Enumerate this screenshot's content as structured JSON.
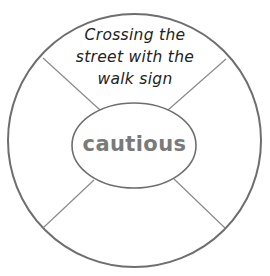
{
  "diagram": {
    "type": "word-wheel-organizer",
    "center": {
      "label": "cautious"
    },
    "sectors": [
      {
        "position": "top",
        "lines": [
          "Crossing the",
          "street with the",
          "walk sign"
        ]
      },
      {
        "position": "left",
        "lines": []
      },
      {
        "position": "right",
        "lines": []
      },
      {
        "position": "bottom",
        "lines": []
      }
    ],
    "colors": {
      "outline": "#6e6e6e",
      "divider": "#8a8a8a",
      "center_text": "#7a7a7a",
      "sector_text": "#222222",
      "background": "#ffffff"
    }
  }
}
